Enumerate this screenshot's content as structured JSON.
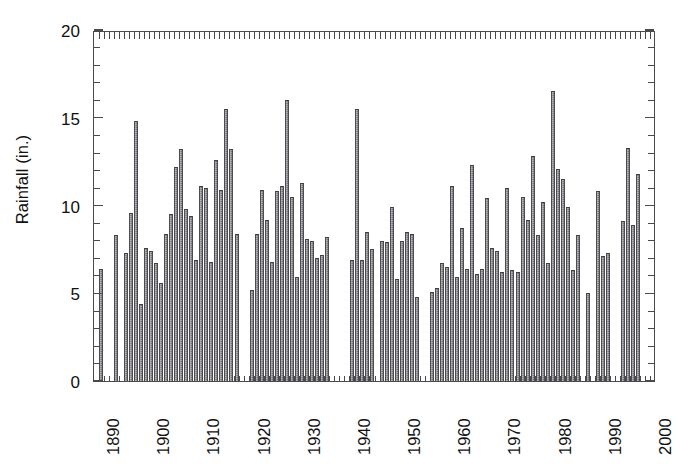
{
  "chart_data": {
    "type": "bar",
    "title": "",
    "xlabel": "",
    "ylabel": "Rainfall (in.)",
    "ylim": [
      0,
      20
    ],
    "xlim": [
      1889,
      2000
    ],
    "yticks": [
      0,
      5,
      10,
      15,
      20
    ],
    "ytick_labels": [
      "0",
      "5",
      "10",
      "15",
      "20"
    ],
    "xticks": [
      1890,
      1900,
      1910,
      1920,
      1930,
      1940,
      1950,
      1960,
      1970,
      1980,
      1990,
      2000
    ],
    "xtick_labels": [
      "1890",
      "1900",
      "1910",
      "1920",
      "1930",
      "1940",
      "1950",
      "1960",
      "1970",
      "1980",
      "1990",
      "2000"
    ],
    "grid": false,
    "legend": null,
    "minor_ticks": "one per year on top and bottom axes; 1-inch intervals on left and right axes",
    "bar_color": "#74747a",
    "frame_color": "#4a4a4a",
    "note": "Annual rainfall histogram; several years have no data (gaps).",
    "categories": [
      1890,
      1891,
      1892,
      1893,
      1894,
      1895,
      1896,
      1897,
      1898,
      1899,
      1900,
      1901,
      1902,
      1903,
      1904,
      1905,
      1906,
      1907,
      1908,
      1909,
      1910,
      1911,
      1912,
      1913,
      1914,
      1915,
      1916,
      1917,
      1918,
      1919,
      1920,
      1921,
      1922,
      1923,
      1924,
      1925,
      1926,
      1927,
      1928,
      1929,
      1930,
      1931,
      1932,
      1933,
      1934,
      1935,
      1936,
      1937,
      1938,
      1939,
      1940,
      1941,
      1942,
      1943,
      1944,
      1945,
      1946,
      1947,
      1948,
      1949,
      1950,
      1951,
      1952,
      1953,
      1954,
      1955,
      1956,
      1957,
      1958,
      1959,
      1960,
      1961,
      1962,
      1963,
      1964,
      1965,
      1966,
      1967,
      1968,
      1969,
      1970,
      1971,
      1972,
      1973,
      1974,
      1975,
      1976,
      1977,
      1978,
      1979,
      1980,
      1981,
      1982,
      1983,
      1984,
      1985,
      1986,
      1987,
      1988,
      1989,
      1990,
      1991,
      1992,
      1993,
      1994,
      1995,
      1996,
      1997,
      1998,
      1999
    ],
    "values": [
      6.4,
      null,
      null,
      8.3,
      null,
      7.3,
      9.6,
      14.8,
      4.4,
      7.6,
      7.4,
      6.7,
      5.6,
      8.4,
      9.5,
      12.2,
      13.2,
      9.8,
      9.4,
      6.9,
      11.1,
      11.0,
      6.8,
      12.6,
      10.9,
      15.5,
      13.2,
      8.4,
      null,
      null,
      5.2,
      8.4,
      10.9,
      9.2,
      6.8,
      10.8,
      11.1,
      16.0,
      10.5,
      5.9,
      11.3,
      8.1,
      8.0,
      7.0,
      7.2,
      8.2,
      null,
      null,
      null,
      null,
      6.9,
      15.5,
      6.9,
      8.5,
      7.5,
      null,
      8.0,
      7.9,
      9.9,
      5.8,
      8.0,
      8.5,
      8.4,
      4.8,
      null,
      null,
      5.1,
      5.3,
      6.7,
      6.5,
      11.1,
      5.9,
      8.7,
      6.4,
      12.3,
      6.1,
      6.4,
      10.4,
      7.6,
      7.4,
      6.2,
      11.0,
      6.3,
      6.2,
      10.5,
      9.2,
      12.8,
      8.3,
      10.2,
      6.7,
      16.5,
      12.1,
      11.5,
      9.9,
      6.3,
      8.3,
      null,
      5.0,
      null,
      10.8,
      7.1,
      7.3,
      null,
      null,
      9.1,
      13.3,
      8.9,
      11.8,
      null,
      null
    ]
  },
  "caption": ""
}
